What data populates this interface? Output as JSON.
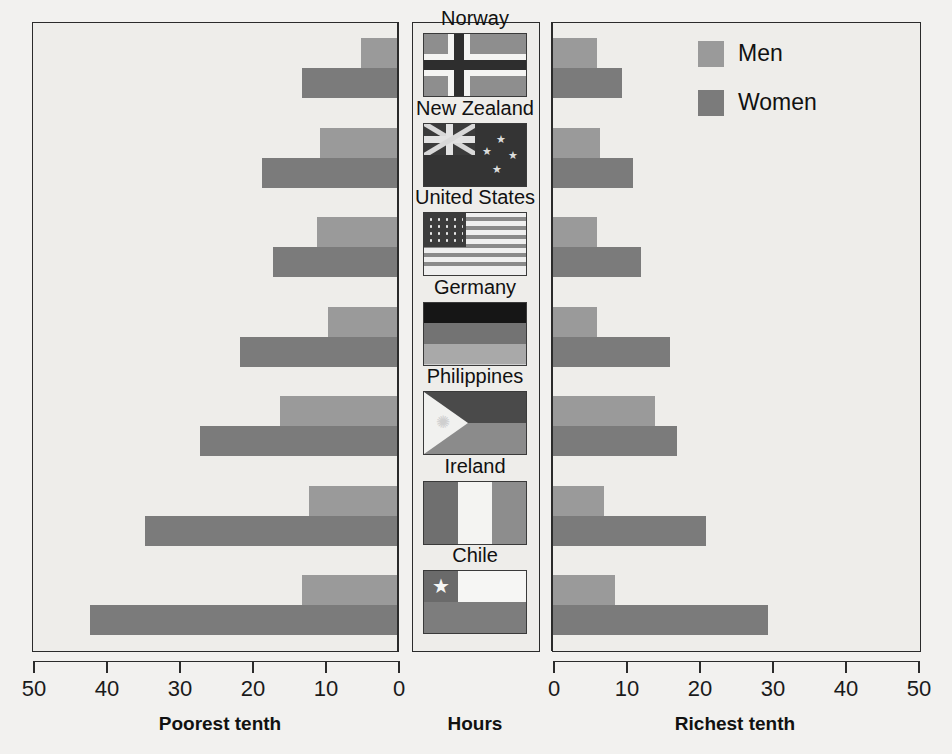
{
  "chart_data": {
    "type": "bar",
    "orientation": "horizontal",
    "style": "diverging-population-pyramid",
    "title": "",
    "xlabel": "Hours",
    "ylabel": "",
    "left_panel": {
      "label": "Poorest tenth",
      "ticks": [
        50,
        40,
        30,
        20,
        10,
        0
      ],
      "xlim": [
        50,
        0
      ]
    },
    "right_panel": {
      "label": "Richest tenth",
      "ticks": [
        0,
        10,
        20,
        30,
        40,
        50
      ],
      "xlim": [
        0,
        50
      ]
    },
    "center_panel": {
      "label": "Hours"
    },
    "categories": [
      "Norway",
      "New Zealand",
      "United States",
      "Germany",
      "Philippines",
      "Ireland",
      "Chile"
    ],
    "legend": {
      "position": "top-right",
      "entries": [
        "Men",
        "Women"
      ]
    },
    "series": [
      {
        "name": "Men",
        "panel": "Poorest tenth",
        "values": [
          5,
          10.5,
          11,
          9.5,
          16,
          12,
          13
        ]
      },
      {
        "name": "Women",
        "panel": "Poorest tenth",
        "values": [
          13,
          18.5,
          17,
          21.5,
          27,
          34.5,
          42
        ]
      },
      {
        "name": "Men",
        "panel": "Richest tenth",
        "values": [
          6,
          6.5,
          6,
          6,
          14,
          7,
          8.5
        ]
      },
      {
        "name": "Women",
        "panel": "Richest tenth",
        "values": [
          9.5,
          11,
          12,
          16,
          17,
          21,
          29.5
        ]
      }
    ],
    "grid": false,
    "colors": {
      "men": "#9a9a9a",
      "women": "#7b7b7b",
      "background": "#eeedea",
      "axis": "#2b2b2b"
    }
  },
  "axes": {
    "left": {
      "title": "Poorest tenth",
      "tick_labels": [
        "50",
        "40",
        "30",
        "20",
        "10",
        "0"
      ]
    },
    "center": {
      "title": "Hours"
    },
    "right": {
      "title": "Richest tenth",
      "tick_labels": [
        "0",
        "10",
        "20",
        "30",
        "40",
        "50"
      ]
    }
  },
  "legend": {
    "items": [
      {
        "label": "Men",
        "color": "#9a9a9a"
      },
      {
        "label": "Women",
        "color": "#7b7b7b"
      }
    ]
  },
  "countries": [
    {
      "name": "Norway",
      "flag": "flag-norway"
    },
    {
      "name": "New Zealand",
      "flag": "flag-new-zealand"
    },
    {
      "name": "United States",
      "flag": "flag-united-states"
    },
    {
      "name": "Germany",
      "flag": "flag-germany"
    },
    {
      "name": "Philippines",
      "flag": "flag-philippines"
    },
    {
      "name": "Ireland",
      "flag": "flag-ireland"
    },
    {
      "name": "Chile",
      "flag": "flag-chile"
    }
  ]
}
